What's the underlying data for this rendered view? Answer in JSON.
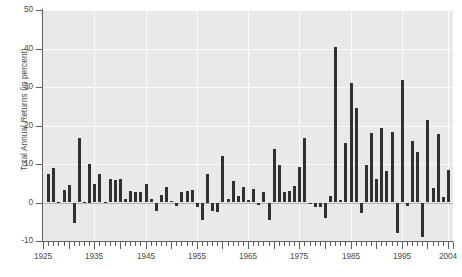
{
  "chart_data": {
    "type": "bar",
    "title": "",
    "subtitle": "",
    "xlabel": "",
    "ylabel": "Total Annual Returns (in percent)",
    "ylim": [
      -10,
      50
    ],
    "xlim": [
      1925,
      2005
    ],
    "ytick_labels": [
      "50",
      "40",
      "30",
      "20",
      "10",
      "0",
      "-10"
    ],
    "ytick_values": [
      50,
      40,
      30,
      20,
      10,
      0,
      -10
    ],
    "xtick_labels": [
      "1925",
      "1935",
      "1945",
      "1955",
      "1965",
      "1975",
      "1985",
      "1995",
      "2004"
    ],
    "xtick_values": [
      1925,
      1935,
      1945,
      1955,
      1965,
      1975,
      1985,
      1995,
      2004
    ],
    "grid": true,
    "grid_color": "#fbfbfb",
    "plot_background": "#e9e9e9",
    "bar_color": "#303030",
    "legend": null,
    "legend_position": "none",
    "categories": [
      1926,
      1927,
      1928,
      1929,
      1930,
      1931,
      1932,
      1933,
      1934,
      1935,
      1936,
      1937,
      1938,
      1939,
      1940,
      1941,
      1942,
      1943,
      1944,
      1945,
      1946,
      1947,
      1948,
      1949,
      1950,
      1951,
      1952,
      1953,
      1954,
      1955,
      1956,
      1957,
      1958,
      1959,
      1960,
      1961,
      1962,
      1963,
      1964,
      1965,
      1966,
      1967,
      1968,
      1969,
      1970,
      1971,
      1972,
      1973,
      1974,
      1975,
      1976,
      1977,
      1978,
      1979,
      1980,
      1981,
      1982,
      1983,
      1984,
      1985,
      1986,
      1987,
      1988,
      1989,
      1990,
      1991,
      1992,
      1993,
      1994,
      1995,
      1996,
      1997,
      1998,
      1999,
      2000,
      2001,
      2002,
      2003,
      2004
    ],
    "values": [
      7.4,
      8.9,
      0.2,
      3.3,
      4.5,
      -5.4,
      16.8,
      0.1,
      10.0,
      4.9,
      7.4,
      0.2,
      6.0,
      5.9,
      6.0,
      0.8,
      3.1,
      2.7,
      2.7,
      4.7,
      1.0,
      -2.3,
      2.0,
      4.0,
      0.4,
      -0.8,
      2.7,
      3.1,
      3.3,
      -1.2,
      -4.5,
      7.5,
      -2.1,
      -2.5,
      12.1,
      1.0,
      5.6,
      1.6,
      4.0,
      0.7,
      3.6,
      -0.7,
      2.6,
      -4.5,
      13.8,
      9.8,
      2.8,
      3.1,
      4.3,
      9.2,
      16.8,
      -0.3,
      -1.2,
      -1.1,
      -4.0,
      1.8,
      40.4,
      0.7,
      15.4,
      31.0,
      24.5,
      -2.7,
      9.7,
      18.1,
      6.2,
      19.3,
      8.1,
      18.2,
      -7.8,
      31.7,
      -0.9,
      15.9,
      13.1,
      -8.9,
      21.5,
      3.7,
      17.8,
      1.4,
      8.5
    ]
  }
}
